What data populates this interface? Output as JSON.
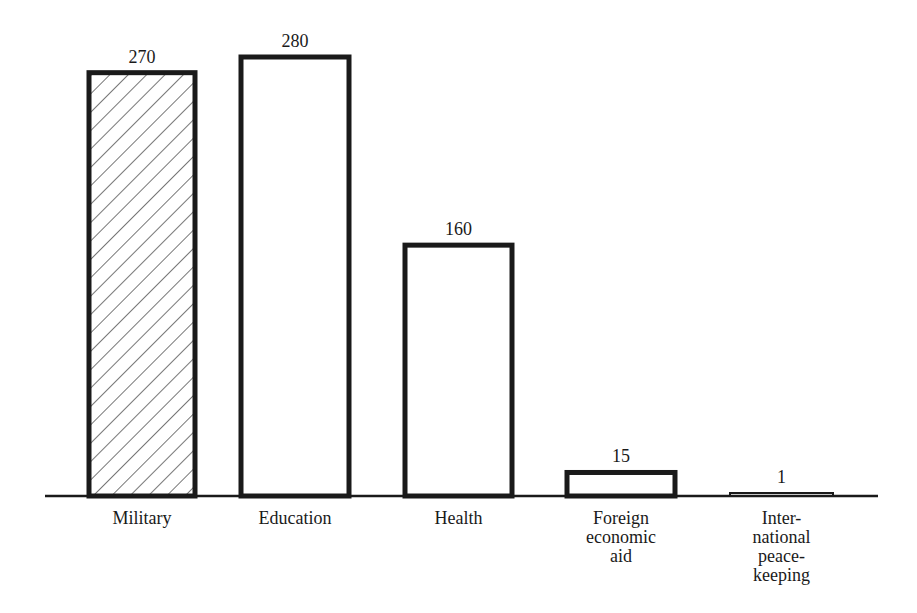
{
  "chart_data": {
    "type": "bar",
    "title": "",
    "xlabel": "",
    "ylabel": "",
    "categories": [
      "Military",
      "Education",
      "Health",
      "Foreign economic aid",
      "International peacekeeping"
    ],
    "category_labels": [
      "Military",
      "Education",
      "Health",
      "Foreign\neconomic\naid",
      "Inter-\nnational\npeace-\nkeeping"
    ],
    "values": [
      270,
      280,
      160,
      15,
      1
    ],
    "value_labels": [
      "270",
      "280",
      "160",
      "15",
      "1"
    ],
    "styles": [
      "hatched",
      "outline",
      "outline",
      "outline",
      "outline"
    ],
    "ylim": [
      0,
      280
    ],
    "grid": false,
    "legend": null
  },
  "colors": {
    "ink": "#1a1a1a",
    "background": "#ffffff"
  }
}
